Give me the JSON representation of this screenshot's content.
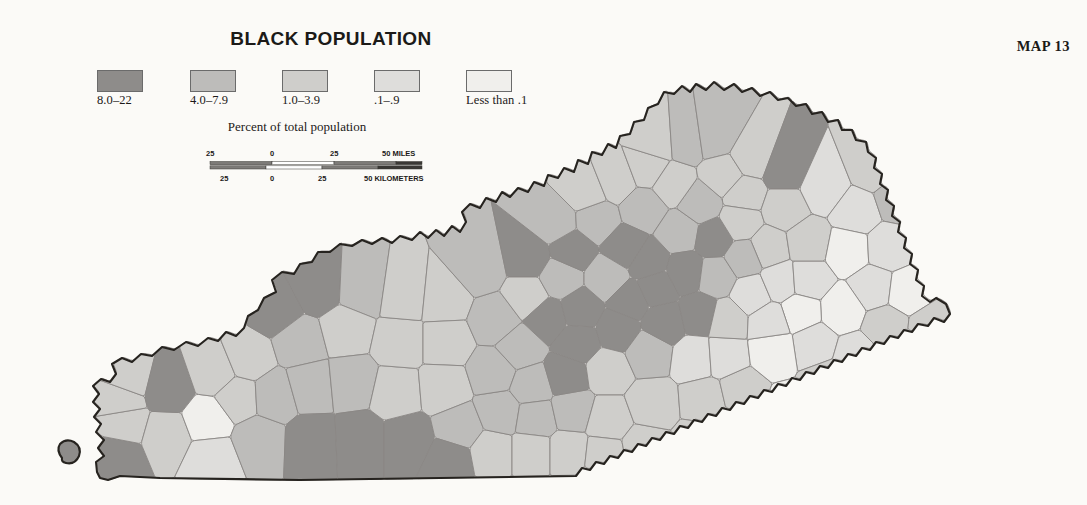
{
  "title": "BLACK POPULATION",
  "map_number": "MAP 13",
  "legend": {
    "caption": "Percent of total population",
    "classes": [
      {
        "label": "8.0–22",
        "color": "#8e8c8a",
        "range_min": 8.0,
        "range_max": 22.0
      },
      {
        "label": "4.0–7.9",
        "color": "#bdbcba",
        "range_min": 4.0,
        "range_max": 7.9
      },
      {
        "label": "1.0–3.9",
        "color": "#cfcecb",
        "range_min": 1.0,
        "range_max": 3.9
      },
      {
        "label": ".1–.9",
        "color": "#dedddb",
        "range_min": 0.1,
        "range_max": 0.9
      },
      {
        "label": "Less than .1",
        "color": "#f0efec",
        "range_min": 0.0,
        "range_max": 0.1
      }
    ]
  },
  "scalebar": {
    "miles_unit": "50 MILES",
    "kilometers_unit": "50 KILOMETERS",
    "miles_ticks": [
      "25",
      "0",
      "25"
    ],
    "km_ticks": [
      "25",
      "0",
      "25"
    ]
  },
  "chart_data": {
    "type": "map",
    "region": "Kentucky",
    "title": "BLACK POPULATION",
    "value_unit": "percent of total population",
    "class_breaks": [
      0.0,
      0.1,
      1.0,
      4.0,
      8.0,
      22.0
    ],
    "class_labels": [
      "Less than .1",
      ".1–.9",
      "1.0–3.9",
      "4.0–7.9",
      "8.0–22"
    ],
    "class_colors": [
      "#f0efec",
      "#dedddb",
      "#cfcecb",
      "#bdbcba",
      "#8e8c8a"
    ],
    "counties": [
      {
        "name": "Fulton",
        "class": 4,
        "cx": 118,
        "cy": 456
      },
      {
        "name": "Hickman",
        "class": 2,
        "cx": 124,
        "cy": 424
      },
      {
        "name": "Carlisle",
        "class": 2,
        "cx": 120,
        "cy": 400
      },
      {
        "name": "Ballard",
        "class": 2,
        "cx": 128,
        "cy": 378
      },
      {
        "name": "Graves",
        "class": 2,
        "cx": 166,
        "cy": 436
      },
      {
        "name": "McCracken",
        "class": 4,
        "cx": 168,
        "cy": 388
      },
      {
        "name": "Marshall",
        "class": 0,
        "cx": 208,
        "cy": 420
      },
      {
        "name": "Calloway",
        "class": 1,
        "cx": 212,
        "cy": 458
      },
      {
        "name": "Livingston",
        "class": 2,
        "cx": 214,
        "cy": 372
      },
      {
        "name": "Lyon",
        "class": 2,
        "cx": 238,
        "cy": 398
      },
      {
        "name": "Crittenden",
        "class": 2,
        "cx": 248,
        "cy": 358
      },
      {
        "name": "Trigg",
        "class": 3,
        "cx": 258,
        "cy": 440
      },
      {
        "name": "Caldwell",
        "class": 3,
        "cx": 274,
        "cy": 396
      },
      {
        "name": "Union",
        "class": 4,
        "cx": 276,
        "cy": 310
      },
      {
        "name": "Webster",
        "class": 3,
        "cx": 300,
        "cy": 342
      },
      {
        "name": "Hopkins",
        "class": 3,
        "cx": 310,
        "cy": 386
      },
      {
        "name": "Christian",
        "class": 4,
        "cx": 312,
        "cy": 442
      },
      {
        "name": "Henderson",
        "class": 4,
        "cx": 318,
        "cy": 288
      },
      {
        "name": "Daviess",
        "class": 3,
        "cx": 362,
        "cy": 290
      },
      {
        "name": "McLean",
        "class": 2,
        "cx": 346,
        "cy": 330
      },
      {
        "name": "Muhlenberg",
        "class": 3,
        "cx": 352,
        "cy": 382
      },
      {
        "name": "Todd",
        "class": 4,
        "cx": 360,
        "cy": 440
      },
      {
        "name": "Logan",
        "class": 4,
        "cx": 408,
        "cy": 440
      },
      {
        "name": "Butler",
        "class": 2,
        "cx": 396,
        "cy": 392
      },
      {
        "name": "Ohio",
        "class": 2,
        "cx": 400,
        "cy": 342
      },
      {
        "name": "Hancock",
        "class": 2,
        "cx": 404,
        "cy": 296
      },
      {
        "name": "Breckinridge",
        "class": 2,
        "cx": 444,
        "cy": 300
      },
      {
        "name": "Grayson",
        "class": 2,
        "cx": 446,
        "cy": 342
      },
      {
        "name": "Edmonson",
        "class": 2,
        "cx": 444,
        "cy": 388
      },
      {
        "name": "Warren",
        "class": 3,
        "cx": 460,
        "cy": 428
      },
      {
        "name": "Simpson",
        "class": 4,
        "cx": 450,
        "cy": 460
      },
      {
        "name": "Allen",
        "class": 2,
        "cx": 492,
        "cy": 452
      },
      {
        "name": "Barren",
        "class": 3,
        "cx": 500,
        "cy": 412
      },
      {
        "name": "Hart",
        "class": 3,
        "cx": 494,
        "cy": 372
      },
      {
        "name": "Hardin",
        "class": 3,
        "cx": 496,
        "cy": 320
      },
      {
        "name": "Meade",
        "class": 3,
        "cx": 480,
        "cy": 268
      },
      {
        "name": "Jefferson",
        "class": 4,
        "cx": 528,
        "cy": 258
      },
      {
        "name": "Bullitt",
        "class": 2,
        "cx": 528,
        "cy": 296
      },
      {
        "name": "Nelson",
        "class": 4,
        "cx": 548,
        "cy": 318
      },
      {
        "name": "Larue",
        "class": 3,
        "cx": 520,
        "cy": 348
      },
      {
        "name": "Green",
        "class": 3,
        "cx": 532,
        "cy": 386
      },
      {
        "name": "Metcalfe",
        "class": 3,
        "cx": 536,
        "cy": 418
      },
      {
        "name": "Monroe",
        "class": 2,
        "cx": 532,
        "cy": 452
      },
      {
        "name": "Cumberland",
        "class": 2,
        "cx": 568,
        "cy": 452
      },
      {
        "name": "Adair",
        "class": 3,
        "cx": 572,
        "cy": 410
      },
      {
        "name": "Taylor",
        "class": 4,
        "cx": 566,
        "cy": 376
      },
      {
        "name": "Marion",
        "class": 4,
        "cx": 578,
        "cy": 342
      },
      {
        "name": "Washington",
        "class": 4,
        "cx": 580,
        "cy": 310
      },
      {
        "name": "Spencer",
        "class": 3,
        "cx": 560,
        "cy": 278
      },
      {
        "name": "Shelby",
        "class": 4,
        "cx": 572,
        "cy": 250
      },
      {
        "name": "Oldham",
        "class": 3,
        "cx": 556,
        "cy": 222
      },
      {
        "name": "Henry",
        "class": 3,
        "cx": 596,
        "cy": 220
      },
      {
        "name": "Trimble",
        "class": 2,
        "cx": 586,
        "cy": 192
      },
      {
        "name": "Carroll",
        "class": 2,
        "cx": 616,
        "cy": 180
      },
      {
        "name": "Gallatin",
        "class": 2,
        "cx": 648,
        "cy": 168
      },
      {
        "name": "Owen",
        "class": 3,
        "cx": 644,
        "cy": 208
      },
      {
        "name": "Franklin",
        "class": 4,
        "cx": 626,
        "cy": 248
      },
      {
        "name": "Anderson",
        "class": 3,
        "cx": 608,
        "cy": 278
      },
      {
        "name": "Mercer",
        "class": 4,
        "cx": 630,
        "cy": 300
      },
      {
        "name": "Boyle",
        "class": 4,
        "cx": 618,
        "cy": 330
      },
      {
        "name": "Casey",
        "class": 2,
        "cx": 608,
        "cy": 370
      },
      {
        "name": "Russell",
        "class": 2,
        "cx": 608,
        "cy": 420
      },
      {
        "name": "Clinton",
        "class": 2,
        "cx": 604,
        "cy": 456
      },
      {
        "name": "Wayne",
        "class": 2,
        "cx": 644,
        "cy": 448
      },
      {
        "name": "Pulaski",
        "class": 2,
        "cx": 652,
        "cy": 404
      },
      {
        "name": "Lincoln",
        "class": 3,
        "cx": 648,
        "cy": 352
      },
      {
        "name": "Garrard",
        "class": 4,
        "cx": 664,
        "cy": 322
      },
      {
        "name": "Jessamine",
        "class": 4,
        "cx": 656,
        "cy": 288
      },
      {
        "name": "Woodford",
        "class": 4,
        "cx": 648,
        "cy": 262
      },
      {
        "name": "Scott",
        "class": 3,
        "cx": 680,
        "cy": 232
      },
      {
        "name": "Fayette",
        "class": 4,
        "cx": 686,
        "cy": 272
      },
      {
        "name": "Madison",
        "class": 4,
        "cx": 700,
        "cy": 314
      },
      {
        "name": "Rockcastle",
        "class": 1,
        "cx": 696,
        "cy": 358
      },
      {
        "name": "Laurel",
        "class": 2,
        "cx": 706,
        "cy": 400
      },
      {
        "name": "Whitley",
        "class": 2,
        "cx": 700,
        "cy": 444
      },
      {
        "name": "McCreary",
        "class": 1,
        "cx": 664,
        "cy": 470
      },
      {
        "name": "Knox",
        "class": 2,
        "cx": 742,
        "cy": 432
      },
      {
        "name": "Bell",
        "class": 3,
        "cx": 760,
        "cy": 462
      },
      {
        "name": "Harlan",
        "class": 3,
        "cx": 806,
        "cy": 452
      },
      {
        "name": "Clay",
        "class": 2,
        "cx": 740,
        "cy": 392
      },
      {
        "name": "Jackson",
        "class": 1,
        "cx": 724,
        "cy": 356
      },
      {
        "name": "Estill",
        "class": 2,
        "cx": 726,
        "cy": 320
      },
      {
        "name": "Clark",
        "class": 3,
        "cx": 716,
        "cy": 276
      },
      {
        "name": "Bourbon",
        "class": 4,
        "cx": 714,
        "cy": 238
      },
      {
        "name": "Harrison",
        "class": 3,
        "cx": 700,
        "cy": 204
      },
      {
        "name": "Grant",
        "class": 2,
        "cx": 672,
        "cy": 184
      },
      {
        "name": "Boone",
        "class": 2,
        "cx": 656,
        "cy": 142
      },
      {
        "name": "Kenton",
        "class": 3,
        "cx": 686,
        "cy": 140
      },
      {
        "name": "Campbell",
        "class": 3,
        "cx": 714,
        "cy": 136
      },
      {
        "name": "Pendleton",
        "class": 2,
        "cx": 724,
        "cy": 176
      },
      {
        "name": "Bracken",
        "class": 2,
        "cx": 752,
        "cy": 158
      },
      {
        "name": "Robertson",
        "class": 2,
        "cx": 744,
        "cy": 194
      },
      {
        "name": "Nicholas",
        "class": 2,
        "cx": 740,
        "cy": 222
      },
      {
        "name": "Mason",
        "class": 4,
        "cx": 784,
        "cy": 170
      },
      {
        "name": "Fleming",
        "class": 2,
        "cx": 784,
        "cy": 208
      },
      {
        "name": "Bath",
        "class": 2,
        "cx": 768,
        "cy": 248
      },
      {
        "name": "Montgomery",
        "class": 3,
        "cx": 744,
        "cy": 258
      },
      {
        "name": "Powell",
        "class": 1,
        "cx": 752,
        "cy": 294
      },
      {
        "name": "Menifee",
        "class": 1,
        "cx": 780,
        "cy": 282
      },
      {
        "name": "Morgan",
        "class": 1,
        "cx": 808,
        "cy": 280
      },
      {
        "name": "Rowan",
        "class": 2,
        "cx": 808,
        "cy": 242
      },
      {
        "name": "Lewis",
        "class": 1,
        "cx": 824,
        "cy": 188
      },
      {
        "name": "Greenup",
        "class": 2,
        "cx": 874,
        "cy": 168
      },
      {
        "name": "Carter",
        "class": 1,
        "cx": 856,
        "cy": 212
      },
      {
        "name": "Boyd",
        "class": 3,
        "cx": 898,
        "cy": 198
      },
      {
        "name": "Elliott",
        "class": 0,
        "cx": 848,
        "cy": 250
      },
      {
        "name": "Lawrence",
        "class": 1,
        "cx": 888,
        "cy": 248
      },
      {
        "name": "Johnson",
        "class": 1,
        "cx": 874,
        "cy": 288
      },
      {
        "name": "Martin",
        "class": 0,
        "cx": 906,
        "cy": 292
      },
      {
        "name": "Magoffin",
        "class": 0,
        "cx": 842,
        "cy": 310
      },
      {
        "name": "Wolfe",
        "class": 0,
        "cx": 800,
        "cy": 312
      },
      {
        "name": "Breathitt",
        "class": 1,
        "cx": 814,
        "cy": 344
      },
      {
        "name": "Floyd",
        "class": 2,
        "cx": 886,
        "cy": 326
      },
      {
        "name": "Knott",
        "class": 1,
        "cx": 856,
        "cy": 356
      },
      {
        "name": "Pike",
        "class": 2,
        "cx": 930,
        "cy": 330
      },
      {
        "name": "Letcher",
        "class": 2,
        "cx": 876,
        "cy": 394
      },
      {
        "name": "Perry",
        "class": 2,
        "cx": 828,
        "cy": 382
      },
      {
        "name": "Owsley",
        "class": 0,
        "cx": 774,
        "cy": 350
      },
      {
        "name": "Lee",
        "class": 1,
        "cx": 770,
        "cy": 322
      },
      {
        "name": "Leslie",
        "class": 0,
        "cx": 790,
        "cy": 412
      },
      {
        "name": "Wolfe2",
        "class": 1,
        "cx": 800,
        "cy": 438
      }
    ]
  }
}
